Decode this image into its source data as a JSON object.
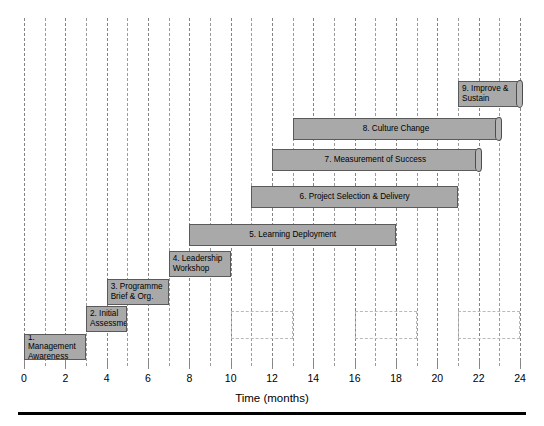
{
  "chart_data": {
    "type": "bar",
    "orientation": "horizontal-gantt",
    "title": "",
    "xlabel": "Time (months)",
    "ylabel": "",
    "xlim": [
      0,
      24
    ],
    "xticks": [
      0,
      2,
      4,
      6,
      8,
      10,
      12,
      14,
      16,
      18,
      20,
      22,
      24
    ],
    "xticklabels": [
      "0",
      "2",
      "4",
      "6",
      "8",
      "10",
      "12",
      "14",
      "16",
      "18",
      "20",
      "22",
      "24"
    ],
    "gridline_interval_months": 1,
    "grid": true,
    "legend": "none",
    "bar_fill_color": "#a9a9a9",
    "bar_border_color": "#5a5a5a",
    "gridline_color": "#8a8a8a",
    "tasks": [
      {
        "id": 1,
        "label": "1. Management Awareness",
        "start": 0,
        "end": 3,
        "align": "left",
        "curl": false
      },
      {
        "id": 2,
        "label": "2. Initial Assessment",
        "start": 3,
        "end": 5,
        "align": "left",
        "curl": false
      },
      {
        "id": 3,
        "label": "3. Programme Brief & Org.",
        "start": 4,
        "end": 7,
        "align": "left",
        "curl": false
      },
      {
        "id": 4,
        "label": "4. Leadership Workshop",
        "start": 7,
        "end": 10,
        "align": "left",
        "curl": false
      },
      {
        "id": 5,
        "label": "5. Learning Deployment",
        "start": 8,
        "end": 18,
        "align": "center",
        "curl": false
      },
      {
        "id": 6,
        "label": "6. Project Selection & Delivery",
        "start": 11,
        "end": 21,
        "align": "center",
        "curl": false
      },
      {
        "id": 7,
        "label": "7. Measurement of Success",
        "start": 12,
        "end": 22,
        "align": "center",
        "curl": true
      },
      {
        "id": 8,
        "label": "8. Culture Change",
        "start": 13,
        "end": 23,
        "align": "center",
        "curl": true
      },
      {
        "id": 9,
        "label": "9. Improve & Sustain",
        "start": 21,
        "end": 24,
        "align": "left",
        "curl": true
      }
    ],
    "placeholder_boxes": [
      {
        "start": 10,
        "end": 13
      },
      {
        "start": 16,
        "end": 19
      },
      {
        "start": 21,
        "end": 24
      }
    ]
  }
}
